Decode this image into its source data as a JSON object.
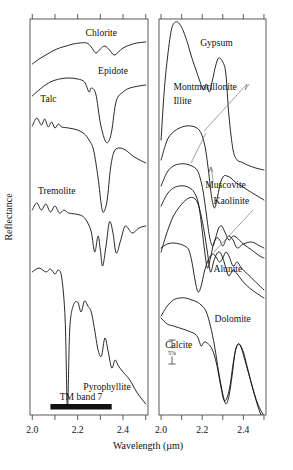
{
  "figure": {
    "axis": {
      "ylabel": "Reflectance",
      "xlabel": "Wavelength (µm)",
      "xticklabels": [
        "2.0",
        "2.2",
        "2.4"
      ],
      "xtickvalues": [
        2.0,
        2.2,
        2.4
      ],
      "xminorticks": [
        2.0,
        2.1,
        2.2,
        2.3,
        2.4,
        2.5
      ],
      "xlim": [
        1.99,
        2.51
      ]
    },
    "annotations": {
      "tm_band": "TM band 7",
      "scale_bar": "5%"
    }
  },
  "chart_data": {
    "type": "line",
    "title": "",
    "subtitle": "",
    "xlabel": "Wavelength (µm)",
    "ylabel": "Reflectance",
    "xlim": [
      1.99,
      2.51
    ],
    "ylim": [
      0,
      1
    ],
    "grid": false,
    "legend": "inline-labels",
    "annotations": [
      {
        "text": "TM band 7",
        "panel": "left",
        "type": "band-marker",
        "x_start": 2.08,
        "x_end": 2.35
      },
      {
        "text": "5%",
        "panel": "right",
        "type": "scale-bar"
      }
    ],
    "panels": [
      {
        "name": "left",
        "series": [
          {
            "name": "Chlorite",
            "label_x": 2.235,
            "label_y_px": 36,
            "x": [
              2.0,
              2.03,
              2.06,
              2.09,
              2.12,
              2.15,
              2.18,
              2.21,
              2.24,
              2.26,
              2.28,
              2.3,
              2.32,
              2.34,
              2.36,
              2.38,
              2.4,
              2.43,
              2.46,
              2.5
            ],
            "y_px": [
              64,
              59,
              55,
              51,
              48,
              46,
              44,
              43,
              43,
              47,
              53,
              49,
              46,
              50,
              55,
              52,
              48,
              45,
              43,
              42
            ]
          },
          {
            "name": "Epidote",
            "label_x": 2.29,
            "label_y_px": 74,
            "x": [
              2.0,
              2.04,
              2.08,
              2.12,
              2.16,
              2.2,
              2.23,
              2.25,
              2.26,
              2.28,
              2.3,
              2.32,
              2.335,
              2.35,
              2.37,
              2.4,
              2.43,
              2.47,
              2.5
            ],
            "y_px": [
              96,
              88,
              82,
              79,
              78,
              79,
              82,
              92,
              88,
              94,
              123,
              140,
              142,
              131,
              101,
              92,
              88,
              86,
              85
            ]
          },
          {
            "name": "Talc",
            "label_x": 2.035,
            "label_y_px": 102,
            "x": [
              2.0,
              2.02,
              2.04,
              2.055,
              2.07,
              2.085,
              2.1,
              2.115,
              2.13,
              2.16,
              2.2,
              2.23,
              2.25,
              2.27,
              2.29,
              2.305,
              2.315,
              2.33,
              2.345,
              2.36,
              2.38,
              2.41,
              2.45,
              2.5
            ],
            "y_px": [
              126,
              118,
              125,
              119,
              127,
              122,
              128,
              124,
              127,
              128,
              130,
              134,
              140,
              150,
              178,
              206,
              212,
              200,
              168,
              152,
              148,
              150,
              157,
              163
            ]
          },
          {
            "name": "Tremolite",
            "label_x": 2.025,
            "label_y_px": 194,
            "x": [
              2.0,
              2.02,
              2.04,
              2.06,
              2.08,
              2.1,
              2.12,
              2.14,
              2.16,
              2.19,
              2.22,
              2.24,
              2.26,
              2.275,
              2.29,
              2.3,
              2.31,
              2.325,
              2.34,
              2.355,
              2.37,
              2.39,
              2.41,
              2.44,
              2.47,
              2.5
            ],
            "y_px": [
              210,
              203,
              210,
              204,
              212,
              206,
              213,
              210,
              213,
              214,
              216,
              221,
              232,
              252,
              236,
              250,
              266,
              246,
              222,
              232,
              253,
              240,
              226,
              233,
              228,
              226
            ]
          },
          {
            "name": "Pyrophyllite",
            "label_x": 2.225,
            "label_y_px": 390,
            "x": [
              2.0,
              2.03,
              2.06,
              2.08,
              2.1,
              2.115,
              2.13,
              2.145,
              2.155,
              2.165,
              2.18,
              2.2,
              2.215,
              2.23,
              2.245,
              2.26,
              2.275,
              2.29,
              2.305,
              2.32,
              2.335,
              2.35,
              2.365,
              2.38,
              2.4,
              2.43,
              2.46,
              2.5
            ],
            "y_px": [
              272,
              268,
              272,
              269,
              274,
              270,
              278,
              320,
              408,
              330,
              306,
              302,
              312,
              301,
              306,
              312,
              330,
              350,
              356,
              338,
              352,
              368,
              360,
              366,
              372,
              380,
              392,
              404
            ]
          }
        ]
      },
      {
        "name": "right",
        "series": [
          {
            "name": "Gypsum",
            "label_x": 2.19,
            "label_y_px": 46,
            "x": [
              2.0,
              2.015,
              2.03,
              2.05,
              2.07,
              2.09,
              2.11,
              2.13,
              2.15,
              2.17,
              2.19,
              2.205,
              2.22,
              2.235,
              2.25,
              2.265,
              2.28,
              2.3,
              2.315,
              2.33,
              2.35,
              2.37,
              2.39,
              2.42,
              2.46,
              2.5
            ],
            "y_px": [
              140,
              92,
              60,
              30,
              22,
              24,
              32,
              44,
              58,
              70,
              82,
              90,
              84,
              92,
              80,
              66,
              58,
              62,
              74,
              116,
              150,
              160,
              162,
              165,
              168,
              170
            ]
          },
          {
            "name": "Montmorillonite",
            "label_x": 2.06,
            "label_y_px": 90,
            "x": [
              2.0,
              2.03,
              2.06,
              2.09,
              2.12,
              2.145,
              2.165,
              2.185,
              2.2,
              2.215,
              2.23,
              2.245,
              2.26,
              2.275,
              2.29,
              2.305,
              2.32,
              2.34,
              2.36,
              2.39,
              2.42,
              2.46,
              2.5
            ],
            "y_px": [
              160,
              140,
              132,
              128,
              126,
              126,
              127,
              130,
              136,
              148,
              170,
              196,
              208,
              196,
              182,
              176,
              176,
              178,
              182,
              186,
              190,
              195,
              200
            ]
          },
          {
            "name": "Illite",
            "label_x": 2.06,
            "label_y_px": 104,
            "x": [
              2.0,
              2.03,
              2.06,
              2.09,
              2.12,
              2.15,
              2.175,
              2.19,
              2.205,
              2.22,
              2.235,
              2.25,
              2.265,
              2.28,
              2.295,
              2.31,
              2.33,
              2.35,
              2.37,
              2.4,
              2.44,
              2.48,
              2.5
            ],
            "y_px": [
              186,
              172,
              166,
              164,
              164,
              166,
              170,
              178,
              192,
              214,
              236,
              246,
              238,
              228,
              226,
              232,
              240,
              236,
              238,
              244,
              250,
              256,
              258
            ]
          },
          {
            "name": "Muscovite",
            "label_x": 2.215,
            "label_y_px": 188,
            "x": [
              2.0,
              2.03,
              2.06,
              2.09,
              2.115,
              2.14,
              2.16,
              2.18,
              2.195,
              2.21,
              2.225,
              2.24,
              2.255,
              2.27,
              2.285,
              2.3,
              2.315,
              2.33,
              2.35,
              2.37,
              2.4,
              2.44,
              2.48,
              2.5
            ],
            "y_px": [
              206,
              194,
              188,
              186,
              186,
              188,
              192,
              202,
              222,
              248,
              268,
              258,
              244,
              238,
              240,
              246,
              240,
              236,
              240,
              248,
              244,
              242,
              246,
              248
            ]
          },
          {
            "name": "Kaolinite",
            "label_x": 2.255,
            "label_y_px": 204,
            "x": [
              2.0,
              2.02,
              2.04,
              2.06,
              2.085,
              2.11,
              2.135,
              2.16,
              2.18,
              2.195,
              2.21,
              2.225,
              2.24,
              2.255,
              2.27,
              2.285,
              2.3,
              2.315,
              2.33,
              2.35,
              2.37,
              2.4,
              2.43,
              2.47,
              2.5
            ],
            "y_px": [
              252,
              238,
              226,
              216,
              208,
              202,
              198,
              198,
              204,
              216,
              232,
              252,
              272,
              262,
              254,
              252,
              258,
              268,
              276,
              270,
              274,
              282,
              288,
              294,
              298
            ]
          },
          {
            "name": "Alunite",
            "label_x": 2.255,
            "label_y_px": 272,
            "x": [
              2.0,
              2.03,
              2.06,
              2.09,
              2.115,
              2.135,
              2.15,
              2.165,
              2.18,
              2.195,
              2.21,
              2.225,
              2.24,
              2.255,
              2.27,
              2.285,
              2.3,
              2.315,
              2.33,
              2.35,
              2.37,
              2.39,
              2.42,
              2.46,
              2.5
            ],
            "y_px": [
              248,
              244,
              243,
              244,
              246,
              250,
              262,
              280,
              292,
              286,
              272,
              262,
              256,
              254,
              258,
              262,
              258,
              252,
              256,
              266,
              262,
              268,
              274,
              282,
              290
            ]
          },
          {
            "name": "Dolomite",
            "label_x": 2.26,
            "label_y_px": 322,
            "x": [
              2.0,
              2.03,
              2.06,
              2.09,
              2.12,
              2.15,
              2.175,
              2.2,
              2.22,
              2.24,
              2.26,
              2.28,
              2.3,
              2.315,
              2.33,
              2.345,
              2.36,
              2.375,
              2.39,
              2.41,
              2.44,
              2.47,
              2.5
            ],
            "y_px": [
              316,
              306,
              300,
              298,
              298,
              300,
              302,
              306,
              312,
              326,
              346,
              372,
              394,
              404,
              396,
              376,
              352,
              344,
              348,
              362,
              384,
              404,
              416
            ]
          },
          {
            "name": "Calcite",
            "label_x": 2.02,
            "label_y_px": 348,
            "x": [
              2.0,
              2.03,
              2.06,
              2.09,
              2.12,
              2.145,
              2.165,
              2.18,
              2.195,
              2.21,
              2.23,
              2.25,
              2.27,
              2.29,
              2.305,
              2.32,
              2.335,
              2.35,
              2.365,
              2.38,
              2.4,
              2.42,
              2.45,
              2.48,
              2.5
            ],
            "y_px": [
              318,
              324,
              326,
              328,
              330,
              332,
              334,
              338,
              346,
              342,
              344,
              350,
              364,
              386,
              400,
              398,
              386,
              364,
              348,
              344,
              352,
              368,
              392,
              412,
              420
            ]
          }
        ]
      }
    ]
  }
}
